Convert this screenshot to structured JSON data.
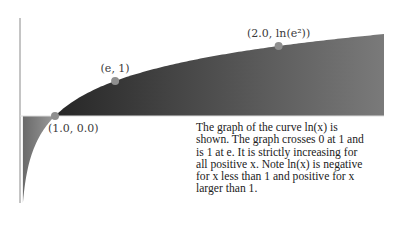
{
  "figure": {
    "function": "ln(x)",
    "domain": [
      0.083,
      10.4
    ],
    "fill_positive_colors": [
      "#262626",
      "#7a7a7a"
    ],
    "fill_negative_colors": [
      "#6a6a6a",
      "#9a9a9a"
    ],
    "point_color": "#8f8f8f",
    "axis_color": "#8a8a8a"
  },
  "points": [
    {
      "x": 1.0,
      "y": 0.0,
      "label": "(1.0, 0.0)",
      "label_pos": "below-right"
    },
    {
      "x": 2.718281828,
      "y": 1.0,
      "label": "(e, 1)",
      "label_pos": "above"
    },
    {
      "x": 7.389056099,
      "y": 2.0,
      "label": "(2.0, ln(e²))",
      "label_pos": "above"
    }
  ],
  "description": {
    "lines": [
      "The graph of the curve ln(x) is",
      "shown. The graph crosses 0 at 1 and",
      "is 1 at e. It is strictly increasing for",
      "all positive x. Note ln(x) is negative",
      "for x less than 1 and positive for x",
      "larger than 1."
    ]
  }
}
